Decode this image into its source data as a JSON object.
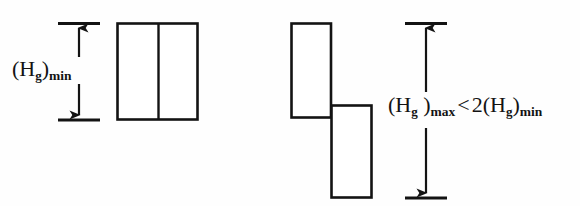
{
  "figure": {
    "background_color": "#fefefe",
    "ink_color": "#131313",
    "width": 580,
    "height": 206
  },
  "left_group": {
    "name": "minimum gauge height case",
    "dimension": {
      "label_parts": {
        "open_paren": "(",
        "symbol": "H",
        "symbol_sub": "g",
        "close_paren": ")",
        "qualifier": "min"
      },
      "label_plain": "(Hg)min"
    },
    "shape": {
      "type": "split-rectangle",
      "panels": 2,
      "x": 117,
      "y": 23,
      "width": 81,
      "height": 97,
      "divider_x": 158
    },
    "arrow": {
      "x": 79,
      "top_y": 23,
      "bottom_y": 120,
      "tick_left": 58,
      "tick_right": 100
    }
  },
  "right_group": {
    "name": "maximum gauge height case",
    "dimension": {
      "label_parts": {
        "open_paren": "(",
        "symbol": "H",
        "symbol_sub": "g",
        "space_before_close": " ",
        "close_paren": ")",
        "qualifier_max": "max",
        "operator": "<",
        "factor": "2",
        "open_paren_2": "(",
        "symbol_2": "H",
        "symbol_2_sub": "g",
        "close_paren_2": ")",
        "qualifier_min": "min"
      },
      "label_plain": "(Hg )max < 2(Hg)min"
    },
    "shape_upper": {
      "type": "rectangle",
      "x": 291,
      "y": 23,
      "width": 40,
      "height": 95
    },
    "shape_lower": {
      "type": "rectangle",
      "x": 331,
      "y": 105,
      "width": 41,
      "height": 93
    },
    "arrow": {
      "x": 426,
      "top_y": 23,
      "bottom_y": 198,
      "tick_left": 405,
      "tick_right": 447
    }
  }
}
